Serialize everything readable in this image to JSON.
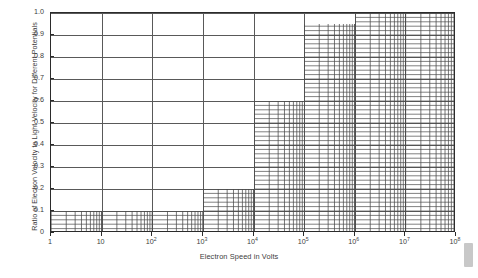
{
  "chart_data": {
    "type": "area",
    "title": "",
    "xlabel": "Electron Speed in Volts",
    "ylabel": "Ratio of Electron Velocity to Light Velocity for Different Potentials",
    "xscale": "log",
    "xlim": [
      1,
      100000000
    ],
    "ylim": [
      0,
      1.0
    ],
    "grid": true,
    "legend": null,
    "x_tick_labels": [
      "1",
      "10",
      "10²",
      "10³",
      "10⁴",
      "10⁵",
      "10⁶",
      "10⁷",
      "10⁸"
    ],
    "x_tick_bases": [
      "1",
      "10",
      "10",
      "10",
      "10",
      "10",
      "10",
      "10",
      "10"
    ],
    "x_tick_exponents": [
      "",
      "",
      "2",
      "3",
      "4",
      "5",
      "6",
      "7",
      "8"
    ],
    "x_tick_values": [
      1,
      10,
      100,
      1000,
      10000,
      100000,
      1000000,
      10000000,
      100000000
    ],
    "y_tick_labels": [
      "0",
      "0.1",
      "0.2",
      "0.3",
      "0.4",
      "0.5",
      "0.6",
      "0.7",
      "0.8",
      "0.9",
      "1.0"
    ],
    "y_tick_values": [
      0,
      0.1,
      0.2,
      0.3,
      0.4,
      0.5,
      0.6,
      0.7,
      0.8,
      0.9,
      1.0
    ],
    "steps": [
      {
        "name": "step-0p1",
        "x_start": 1,
        "x_end": 1000,
        "value": 0.1
      },
      {
        "name": "step-0p2",
        "x_start": 1000,
        "x_end": 10000,
        "value": 0.2
      },
      {
        "name": "step-0p6",
        "x_start": 10000,
        "x_end": 100000,
        "value": 0.6
      },
      {
        "name": "step-0p95",
        "x_start": 100000,
        "x_end": 1000000,
        "value": 0.95
      },
      {
        "name": "step-1p0",
        "x_start": 1000000,
        "x_end": 100000000,
        "value": 1.0
      }
    ],
    "series": [
      {
        "name": "Electron velocity ratio",
        "x": [
          1,
          1000,
          10000,
          100000,
          1000000,
          100000000
        ],
        "values": [
          0.1,
          0.1,
          0.2,
          0.6,
          0.95,
          1.0
        ]
      }
    ]
  },
  "artifacts": {
    "scrollbar_thumb": "scrollbar-thumb"
  },
  "colors": {
    "axis": "#2b2b2b",
    "grid": "#595959",
    "hatch": "#4a4a4a",
    "background": "#ffffff",
    "text": "#3d3d3d",
    "scrollbar": "#c8c8c8"
  }
}
